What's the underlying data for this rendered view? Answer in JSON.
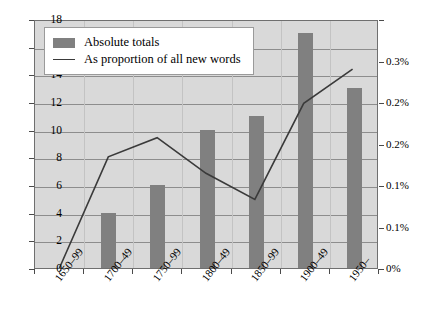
{
  "chart_data": {
    "type": "bar",
    "title": "",
    "subtitle": "",
    "xlabel": "",
    "ylabel": "",
    "ylabel_right": "",
    "categories": [
      "1650–99",
      "1700–49",
      "1750–99",
      "1800–49",
      "1850–99",
      "1900–49",
      "1950–"
    ],
    "ylim": [
      0,
      18
    ],
    "ylim_right": [
      0,
      0.3
    ],
    "yticks": [
      0,
      2,
      4,
      6,
      8,
      10,
      12,
      14,
      16,
      18
    ],
    "ytick_labels": [
      "0",
      "2",
      "4",
      "6",
      "8",
      "10",
      "12",
      "14",
      "16",
      "18"
    ],
    "yticks_right": [
      0,
      0.05,
      0.1,
      0.15,
      0.2,
      0.25,
      0.3
    ],
    "ytick_labels_right": [
      "0%",
      "0.1%",
      "0.1%",
      "0.2%",
      "0.2%",
      "0.3%"
    ],
    "ytick_right_positions": [
      0,
      0.05,
      0.1,
      0.15,
      0.2,
      0.25,
      0.3
    ],
    "grid": true,
    "legend_position": "top-left",
    "series": [
      {
        "name": "Absolute totals",
        "type": "bar",
        "axis": "left",
        "color": "#808080",
        "values": [
          0,
          4,
          6,
          10,
          11,
          17,
          13
        ]
      },
      {
        "name": "As proportion of all new words",
        "type": "line",
        "axis": "right",
        "color": "#3a3a3a",
        "values": [
          0,
          0.135,
          0.16,
          0.115,
          0.085,
          0.2,
          0.245
        ],
        "values_left_scale": [
          0,
          8.1,
          9.5,
          6.9,
          5.0,
          12.0,
          14.5
        ]
      }
    ]
  },
  "legend": {
    "items": [
      {
        "label": "Absolute totals",
        "marker": "swatch"
      },
      {
        "label": "As proportion of all new words",
        "marker": "line"
      }
    ]
  },
  "colors": {
    "bar": "#808080",
    "line": "#3a3a3a",
    "plot_background": "#d9d9d9",
    "gridline": "#8d8d8d",
    "axis": "#6f6f6f",
    "page_background": "#ffffff"
  }
}
